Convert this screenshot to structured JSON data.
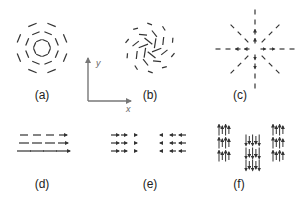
{
  "panels": [
    {
      "id": "a",
      "label": "(a)",
      "pattern": "clockwise-vortex-concentric-rings"
    },
    {
      "id": "b",
      "label": "(b)",
      "pattern": "swirl-spiral-vortex"
    },
    {
      "id": "c",
      "label": "(c)",
      "pattern": "radial-outward-star"
    },
    {
      "id": "d",
      "label": "(d)",
      "pattern": "uniform-rightward-grid"
    },
    {
      "id": "e",
      "label": "(e)",
      "pattern": "opposing-domains-right-left"
    },
    {
      "id": "f",
      "label": "(f)",
      "pattern": "alternating-up-down-domains"
    }
  ],
  "axes": {
    "x_label": "x",
    "y_label": "y"
  },
  "colors": {
    "arrow": "#333333",
    "axis": "#777777",
    "text": "#222222"
  }
}
